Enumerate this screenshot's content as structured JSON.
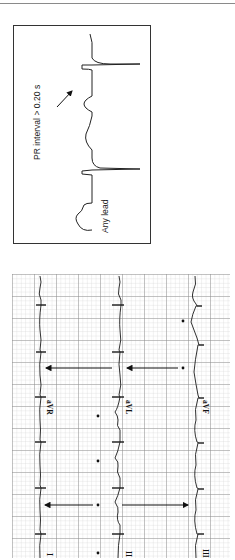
{
  "figure": {
    "diagram_panel": {
      "annotation": "PR interval > 0.20 s",
      "lead_caption": "Any lead"
    },
    "ecg_strip": {
      "leads_top_row": [
        "aVR",
        "aVL",
        "aVF"
      ],
      "leads_bottom_row": [
        "I",
        "II",
        "III"
      ],
      "marker_symbol": "*",
      "grid_color": "#9a9a9a",
      "trace_color": "#222222"
    }
  }
}
